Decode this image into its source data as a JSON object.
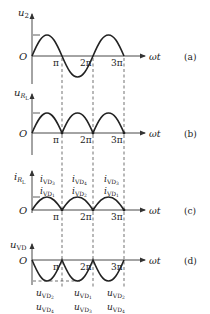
{
  "figure": {
    "x_axis_label": "ωt",
    "origin_label": "O",
    "ticks": [
      "π",
      "2π",
      "3π"
    ],
    "panels": [
      {
        "id": "a",
        "tag": "(a)",
        "y_label_main": "u",
        "y_label_sub": "2",
        "waveform": "sine"
      },
      {
        "id": "b",
        "tag": "(b)",
        "y_label_main": "u",
        "y_label_sub": "R",
        "y_label_subsub": "L",
        "waveform": "full-wave rectified"
      },
      {
        "id": "c",
        "tag": "(c)",
        "y_label_main": "i",
        "y_label_sub": "R",
        "y_label_subsub": "L",
        "waveform": "full-wave rectified (smaller amplitude)",
        "half_cycle_labels": [
          {
            "top_main": "i",
            "top_sub": "VD",
            "top_idx": "3",
            "bottom_main": "i",
            "bottom_sub": "VD",
            "bottom_idx": "1"
          },
          {
            "top_main": "i",
            "top_sub": "VD",
            "top_idx": "4",
            "bottom_main": "i",
            "bottom_sub": "VD",
            "bottom_idx": "2"
          },
          {
            "top_main": "i",
            "top_sub": "VD",
            "top_idx": "3",
            "bottom_main": "i",
            "bottom_sub": "VD",
            "bottom_idx": "1"
          }
        ]
      },
      {
        "id": "d",
        "tag": "(d)",
        "y_label_main": "u",
        "y_label_sub": "VD",
        "waveform": "inverted rectified (negative lobes)",
        "half_cycle_labels": [
          {
            "top_main": "u",
            "top_sub": "VD",
            "top_idx": "2",
            "bottom_main": "u",
            "bottom_sub": "VD",
            "bottom_idx": "4"
          },
          {
            "top_main": "u",
            "top_sub": "VD",
            "top_idx": "1",
            "bottom_main": "u",
            "bottom_sub": "VD",
            "bottom_idx": "3"
          },
          {
            "top_main": "u",
            "top_sub": "VD",
            "top_idx": "2",
            "bottom_main": "u",
            "bottom_sub": "VD",
            "bottom_idx": "4"
          }
        ]
      }
    ]
  }
}
